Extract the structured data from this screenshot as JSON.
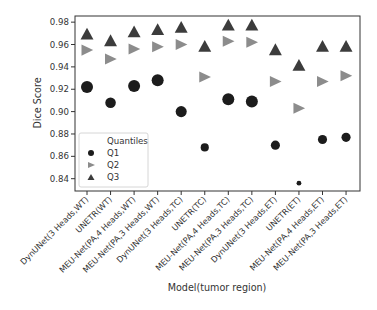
{
  "chart_data": {
    "type": "scatter",
    "title": "",
    "xlabel": "Model(tumor region)",
    "ylabel": "Dice Score",
    "categories": [
      "DynUNet(3 Heads,WT)",
      "UNETR(WT)",
      "MEU-Net(PA,4 Heads,WT)",
      "MEU-Net(PA,3 Heads,WT)",
      "DynUNet(3 Heads,TC)",
      "UNETR(TC)",
      "MEU-Net(PA,4 Heads,TC)",
      "MEU-Net(PA,3 Heads,TC)",
      "DynUNet(3 Heads,ET)",
      "UNETR(ET)",
      "MEU-Net(PA,4 Heads,ET)",
      "MEU-Net(PA,3 Heads,ET)"
    ],
    "yticks": [
      0.84,
      0.86,
      0.88,
      0.9,
      0.92,
      0.94,
      0.96,
      0.98
    ],
    "ytick_labels": [
      "0.84",
      "0.86",
      "0.88",
      "0.90",
      "0.92",
      "0.94",
      "0.96",
      "0.98"
    ],
    "ylim": [
      0.829,
      0.9855
    ],
    "grid": false,
    "legend": {
      "title": "Quantiles",
      "placement": "lower-left",
      "entries": [
        "Q1",
        "Q2",
        "Q3"
      ]
    },
    "series": [
      {
        "name": "Q1",
        "marker": "circle",
        "color": "#1c1c1c",
        "values": [
          0.922,
          0.908,
          0.923,
          0.928,
          0.9,
          0.868,
          0.911,
          0.909,
          0.87,
          0.836,
          0.875,
          0.877
        ],
        "marker_size_level": [
          1.0,
          0.85,
          1.0,
          1.0,
          0.9,
          0.6,
          1.0,
          1.0,
          0.7,
          0.25,
          0.7,
          0.7
        ]
      },
      {
        "name": "Q2",
        "marker": "triangle-right",
        "color": "#8c8c8c",
        "values": [
          0.955,
          0.947,
          0.956,
          0.958,
          0.96,
          0.931,
          0.963,
          0.962,
          0.927,
          0.903,
          0.927,
          0.932
        ]
      },
      {
        "name": "Q3",
        "marker": "triangle-up",
        "color": "#3c3c3c",
        "values": [
          0.969,
          0.963,
          0.971,
          0.973,
          0.975,
          0.958,
          0.977,
          0.977,
          0.955,
          0.941,
          0.958,
          0.958
        ]
      }
    ]
  }
}
